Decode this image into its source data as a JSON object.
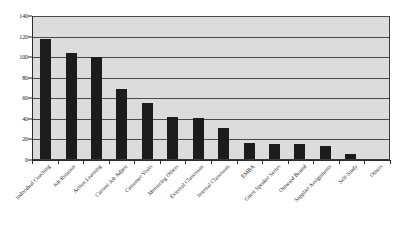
{
  "chart_data": {
    "type": "bar",
    "title": "",
    "subtitle": "",
    "xlabel": "",
    "ylabel": "",
    "ylim": [
      0,
      140
    ],
    "ytick_step": 20,
    "yticks": [
      "0",
      "20",
      "40",
      "60",
      "80",
      "100",
      "120",
      "140"
    ],
    "grid": true,
    "legend": false,
    "legend_position": "none",
    "bar_color": "#1c1c1c",
    "plot_background": "#dcdcdc",
    "categories": [
      "Individual Coaching",
      "Job Rotation",
      "Action Learning",
      "Current Job Adjust",
      "Customer Visits",
      "Mentoring Others",
      "External Classroom",
      "Internal Classroom",
      "EMBA",
      "Guest Speaker Series",
      "Outward Bound",
      "Supplier Assignments",
      "Self-Study",
      "Others"
    ],
    "values": [
      117,
      103,
      99,
      68,
      54,
      41,
      40,
      30,
      16,
      15,
      15,
      13,
      5,
      0
    ]
  }
}
